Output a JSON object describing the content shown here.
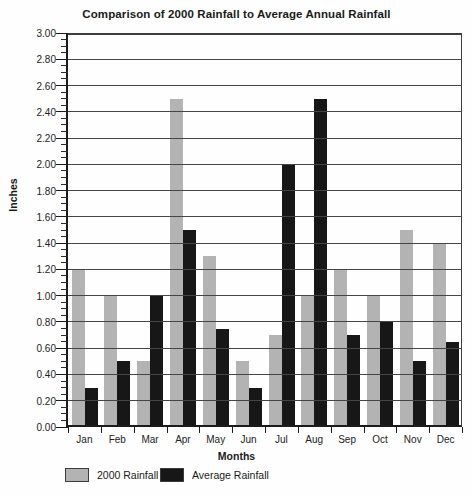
{
  "title": "Comparison of 2000 Rainfall to Average Annual Rainfall",
  "chart_data": {
    "type": "bar",
    "title": "Comparison of 2000 Rainfall to Average Annual Rainfall",
    "categories": [
      "Jan",
      "Feb",
      "Mar",
      "Apr",
      "May",
      "Jun",
      "Jul",
      "Aug",
      "Sep",
      "Oct",
      "Nov",
      "Dec"
    ],
    "series": [
      {
        "name": "2000 Rainfall",
        "color": "#b3b3b3",
        "values": [
          1.2,
          1.0,
          0.5,
          2.5,
          1.3,
          0.5,
          0.7,
          1.0,
          1.2,
          1.0,
          1.5,
          1.4
        ]
      },
      {
        "name": "Average Rainfall",
        "color": "#171717",
        "values": [
          0.3,
          0.5,
          1.0,
          1.5,
          0.75,
          0.3,
          2.0,
          2.5,
          0.7,
          0.8,
          0.5,
          0.65
        ]
      }
    ],
    "xlabel": "Months",
    "ylabel": "Inches",
    "ylim": [
      0.0,
      3.0
    ],
    "ytick_step": 0.2,
    "ytick_labels": [
      "0.00",
      "0.20",
      "0.40",
      "0.60",
      "0.80",
      "1.00",
      "1.20",
      "1.40",
      "1.60",
      "1.80",
      "2.00",
      "2.20",
      "2.40",
      "2.60",
      "2.80",
      "3.00"
    ],
    "y_minor_step": 0.05,
    "grid": true,
    "gridlines_over_bars": true,
    "legend_position": "bottom"
  },
  "legend": {
    "items": [
      {
        "label": "2000 Rainfall",
        "color": "#b3b3b3"
      },
      {
        "label": "Average Rainfall",
        "color": "#171717"
      }
    ]
  }
}
